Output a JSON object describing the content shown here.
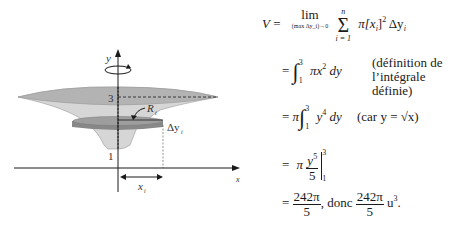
{
  "figure": {
    "axis_y_label": "y",
    "axis_x_label": "x",
    "tick_3": "3",
    "tick_1": "1",
    "radius_label": "R",
    "radius_sub": "i",
    "thickness_label": "Δy",
    "thickness_sub": "i",
    "xi_label": "x",
    "xi_sub": "i",
    "colors": {
      "surface_top": "#b3b3b3",
      "surface_side": "#d6d6d6",
      "disk_top": "#9e9e9e",
      "disk_side": "#888888",
      "ink": "#1a1a1a"
    }
  },
  "equations": {
    "line1": {
      "lhs": "V",
      "eq": "=",
      "lim": "lim",
      "lim_sub": "(max Δy_i)→0",
      "sum_top": "n",
      "sum_bottom": "i = 1",
      "term": "π[x",
      "term_sub": "i",
      "term_rest": "]",
      "sq": "2",
      "dy": "Δy",
      "dy_sub": "i"
    },
    "line2": {
      "eq": "=",
      "int_upper": "3",
      "int_lower": "1",
      "integrand": "πx",
      "pow": "2",
      "diff": "dy",
      "note1": "(définition de",
      "note2": "l’intégrale définie)"
    },
    "line3": {
      "eq": "=",
      "pi": "π",
      "int_upper": "3",
      "int_lower": "1",
      "integrand": "y",
      "pow": "4",
      "diff": "dy",
      "note": "(car y = √x)"
    },
    "line4": {
      "eq": "=",
      "pi": "π",
      "num": "y",
      "num_pow": "5",
      "den": "5",
      "eval_upper": "3",
      "eval_lower": "1"
    },
    "line5": {
      "eq": "=",
      "num": "242π",
      "den": "5",
      "mid": ", donc",
      "num2": "242π",
      "den2": "5",
      "unit": "u",
      "unit_pow": "3",
      "end": "."
    }
  }
}
